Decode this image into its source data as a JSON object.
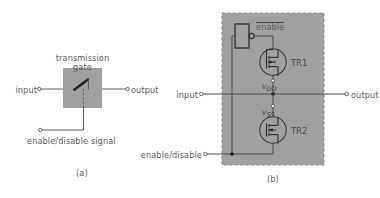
{
  "figure": {
    "panels": [
      {
        "id": "a",
        "caption": "(a)",
        "block_label_line1": "transmission",
        "block_label_line2": "gate",
        "input_label": "input",
        "output_label": "output",
        "control_label": "enable/disable signal"
      },
      {
        "id": "b",
        "caption": "(b)",
        "enable_label": "enable",
        "input_label": "input",
        "output_label": "output",
        "control_label": "enable/disable",
        "transistor_top": "TR1",
        "transistor_bottom": "TR2",
        "supply_top": "V",
        "supply_top_sub": "DD",
        "supply_bottom": "V",
        "supply_bottom_sub": "SS"
      }
    ]
  },
  "colors": {
    "background": "#ffffff",
    "block_fill": "#a0a0a0",
    "panel_fill": "#a0a0a0",
    "line": "#4a4a4a",
    "text": "#5b5b5b"
  }
}
